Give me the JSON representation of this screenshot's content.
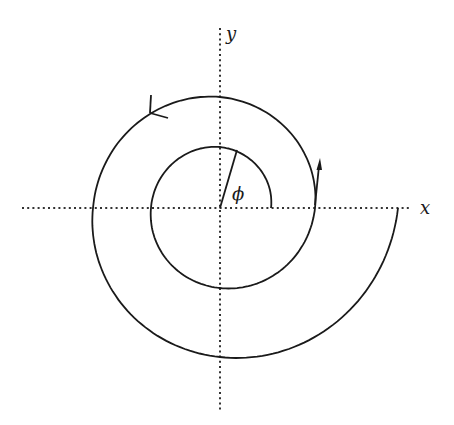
{
  "diagram": {
    "axes": {
      "x_label": "x",
      "y_label": "y",
      "style": "dotted"
    },
    "angle_label": "ϕ",
    "origin_px": [
      220,
      208
    ],
    "spiral": {
      "type": "growing spiral, counter-clockwise",
      "turns": 2,
      "radius_samples_px": [
        {
          "phi_deg": 0,
          "r": 51
        },
        {
          "phi_deg": 90,
          "r": 61
        },
        {
          "phi_deg": 180,
          "r": 69
        },
        {
          "phi_deg": 270,
          "r": 80
        },
        {
          "phi_deg": 360,
          "r": 95
        },
        {
          "phi_deg": 450,
          "r": 111
        },
        {
          "phi_deg": 540,
          "r": 127
        },
        {
          "phi_deg": 630,
          "r": 149
        },
        {
          "phi_deg": 720,
          "r": 178
        }
      ]
    },
    "annotations": [
      {
        "type": "velocity-arrow",
        "at_phi_deg": 360,
        "direction": "up"
      },
      {
        "type": "direction-chevron",
        "at_phi_deg": 490,
        "direction": "counter-clockwise"
      },
      {
        "type": "radius-line",
        "at_phi_deg": 73
      }
    ],
    "colors": {
      "stroke": "#1a1a1a",
      "axis": "#333333",
      "background": "#ffffff"
    }
  }
}
